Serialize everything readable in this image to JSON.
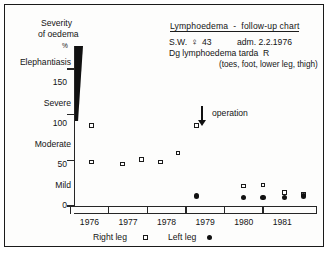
{
  "header": {
    "title": "Lymphoedema  -  follow-up chart",
    "patient_initials": "S.W.",
    "sex_symbol": "♀",
    "age": "43",
    "admission": "adm. 2.2.1976",
    "diagnosis": "Dg lymphoedema tarda  R",
    "sites": "(toes, foot, lower leg, thigh)"
  },
  "axes": {
    "y_title_line1": "Severity",
    "y_title_line2": "of oedema",
    "y_unit": "%",
    "y_ticks": [
      "150",
      "100",
      "50",
      "0"
    ],
    "severity_labels": [
      "Elephantiasis",
      "Severe",
      "Moderate",
      "Mild"
    ],
    "x_ticks": [
      "1976",
      "1977",
      "1978",
      "1979",
      "1980",
      "1981"
    ]
  },
  "annotation": {
    "operation_label": "operation",
    "operation_year": 1978.92
  },
  "legend": {
    "right_leg": "Right leg",
    "right_marker": "open-square",
    "left_leg": "Left leg",
    "left_marker": "filled-circle"
  },
  "colors": {
    "ink": "#1a1a1a",
    "paper": "#fdfdfc",
    "marker_fill": "#111111"
  },
  "chart_data": {
    "type": "scatter",
    "title": "Lymphoedema - follow-up chart",
    "xlabel": "",
    "ylabel": "Severity of oedema (%)",
    "xlim": [
      1975.6,
      1981.9
    ],
    "ylim": [
      0,
      175
    ],
    "grid": false,
    "legend_position": "below-axis",
    "y_tick_values": [
      0,
      50,
      100,
      150
    ],
    "y_category_bands": [
      {
        "label": "Mild",
        "range": [
          0,
          50
        ]
      },
      {
        "label": "Moderate",
        "range": [
          50,
          100
        ]
      },
      {
        "label": "Severe",
        "range": [
          100,
          150
        ]
      },
      {
        "label": "Elephantiasis",
        "range": [
          150,
          175
        ]
      }
    ],
    "x_tick_values": [
      1976,
      1977,
      1978,
      1979,
      1980,
      1981
    ],
    "annotations": [
      {
        "text": "operation",
        "x": 1978.92,
        "y": 112,
        "type": "down-arrow"
      }
    ],
    "series": [
      {
        "name": "Right leg",
        "marker": "open-square",
        "points": [
          {
            "x": 1976.05,
            "y": 88
          },
          {
            "x": 1976.05,
            "y": 48
          },
          {
            "x": 1976.85,
            "y": 46
          },
          {
            "x": 1977.35,
            "y": 51
          },
          {
            "x": 1977.85,
            "y": 48
          },
          {
            "x": 1978.3,
            "y": 58
          },
          {
            "x": 1978.78,
            "y": 88
          },
          {
            "x": 1980.0,
            "y": 22
          },
          {
            "x": 1980.5,
            "y": 23
          },
          {
            "x": 1981.05,
            "y": 15
          },
          {
            "x": 1981.55,
            "y": 13
          }
        ]
      },
      {
        "name": "Left leg",
        "marker": "filled-circle",
        "points": [
          {
            "x": 1978.78,
            "y": 11
          },
          {
            "x": 1980.0,
            "y": 9
          },
          {
            "x": 1980.5,
            "y": 9
          },
          {
            "x": 1981.05,
            "y": 9
          },
          {
            "x": 1981.55,
            "y": 11
          }
        ]
      }
    ]
  }
}
